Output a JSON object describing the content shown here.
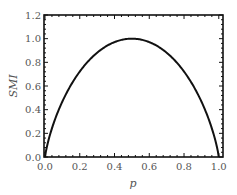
{
  "chart_data": {
    "type": "line",
    "title": "",
    "xlabel": "p",
    "ylabel": "SMI",
    "xlim": [
      0.0,
      1.03
    ],
    "ylim": [
      0.0,
      1.2
    ],
    "xticks": [
      "0.0",
      "0.2",
      "0.4",
      "0.6",
      "0.8",
      "1.0"
    ],
    "yticks": [
      "0.0",
      "0.2",
      "0.4",
      "0.6",
      "0.8",
      "1.0",
      "1.2"
    ],
    "grid": false,
    "legend": null,
    "series": [
      {
        "name": "SMI(p)",
        "x": [
          0.0,
          0.01,
          0.05,
          0.1,
          0.2,
          0.3,
          0.4,
          0.5,
          0.6,
          0.7,
          0.8,
          0.9,
          0.95,
          0.99,
          1.0
        ],
        "y": [
          0.0,
          0.081,
          0.286,
          0.469,
          0.722,
          0.881,
          0.971,
          1.0,
          0.971,
          0.881,
          0.722,
          0.469,
          0.286,
          0.081,
          0.0
        ]
      }
    ],
    "colors": {
      "line": "#111111",
      "axes": "#111111",
      "text": "#555555"
    }
  }
}
